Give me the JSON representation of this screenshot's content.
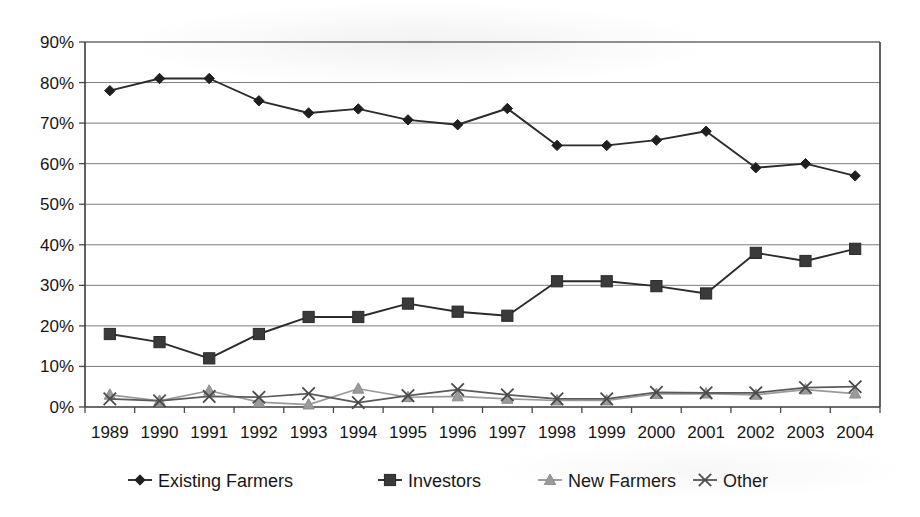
{
  "chart_data": {
    "type": "line",
    "title": "",
    "subtitle": "",
    "xlabel": "",
    "ylabel": "",
    "ylim": [
      0,
      90
    ],
    "ytick_labels": [
      "90%",
      "80%",
      "70%",
      "60%",
      "50%",
      "40%",
      "30%",
      "20%",
      "10%",
      "0%"
    ],
    "ytick_values": [
      90,
      80,
      70,
      60,
      50,
      40,
      30,
      20,
      10,
      0
    ],
    "grid": true,
    "grid_axis": "y",
    "legend_position": "bottom",
    "categories": [
      "1989",
      "1990",
      "1991",
      "1992",
      "1993",
      "1994",
      "1995",
      "1996",
      "1997",
      "1998",
      "1999",
      "2000",
      "2001",
      "2002",
      "2003",
      "2004"
    ],
    "x": [
      1989,
      1990,
      1991,
      1992,
      1993,
      1994,
      1995,
      1996,
      1997,
      1998,
      1999,
      2000,
      2001,
      2002,
      2003,
      2004
    ],
    "series": [
      {
        "name": "Existing Farmers",
        "marker": "diamond",
        "color": "#2b2b2b",
        "values": [
          78.0,
          81.0,
          81.0,
          75.5,
          72.5,
          73.5,
          70.8,
          69.6,
          73.6,
          64.5,
          64.5,
          65.8,
          68.0,
          59.0,
          60.0,
          57.0
        ]
      },
      {
        "name": "Investors",
        "marker": "square",
        "color": "#3a3a3a",
        "values": [
          18.0,
          16.0,
          12.0,
          18.0,
          22.2,
          22.2,
          25.5,
          23.5,
          22.5,
          31.0,
          31.0,
          29.8,
          28.0,
          38.0,
          36.0,
          39.0
        ]
      },
      {
        "name": "New Farmers",
        "marker": "triangle",
        "color": "#9a9a9a",
        "values": [
          3.0,
          1.5,
          4.0,
          1.2,
          0.6,
          4.5,
          2.4,
          2.6,
          2.0,
          1.6,
          1.6,
          3.2,
          3.3,
          3.0,
          4.3,
          3.3
        ]
      },
      {
        "name": "Other",
        "marker": "cross",
        "color": "#5a5a5a",
        "values": [
          2.0,
          1.5,
          2.6,
          2.4,
          3.3,
          1.1,
          2.8,
          4.3,
          3.0,
          2.0,
          2.0,
          3.6,
          3.5,
          3.5,
          4.8,
          5.0
        ]
      }
    ]
  },
  "legend": {
    "items": [
      {
        "label": "Existing Farmers",
        "marker": "diamond"
      },
      {
        "label": "Investors",
        "marker": "square"
      },
      {
        "label": "New Farmers",
        "marker": "triangle"
      },
      {
        "label": "Other",
        "marker": "cross"
      }
    ]
  }
}
